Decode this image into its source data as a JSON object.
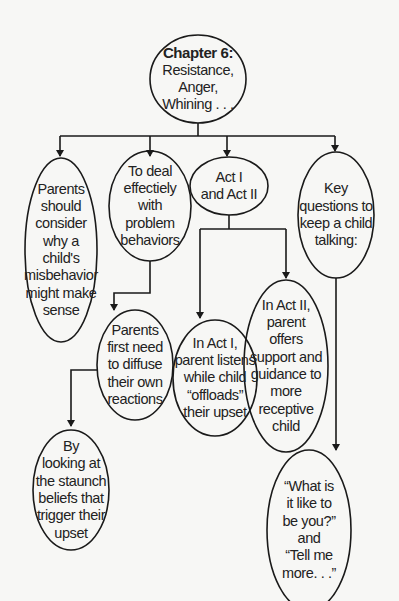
{
  "diagram": {
    "root": {
      "title": "Chapter 6:",
      "subtitle": "Resistance, Anger,\nWhining . . ."
    },
    "nodes": {
      "consider": {
        "text": "Parents\nshould\nconsider\nwhy a child's\nmisbehavior\nmight make\nsense"
      },
      "deal": {
        "text": "To deal\neffectiely\nwith\nproblem\nbehaviors"
      },
      "acts": {
        "text": "Act I\nand Act II"
      },
      "questions": {
        "text": "Key\nquestions to\nkeep a child\ntalking:"
      },
      "diffuse": {
        "text": "Parents\nfirst need\nto diffuse\ntheir own\nreactions"
      },
      "act1": {
        "text": "In Act I,\nparent listens\nwhile child\n“offloads”\ntheir upset"
      },
      "act2": {
        "text": "In Act II,\nparent\noffers\nsupport and\nguidance to\nmore\nreceptive\nchild"
      },
      "beliefs": {
        "text": "By\nlooking at\nthe staunch\nbeliefs that\ntrigger their\nupset"
      },
      "quotes": {
        "text": "“What is\nit like to\nbe you?”\nand\n“Tell me\nmore. . .”"
      }
    },
    "edges": [
      [
        "root",
        "consider"
      ],
      [
        "root",
        "deal"
      ],
      [
        "root",
        "acts"
      ],
      [
        "root",
        "questions"
      ],
      [
        "deal",
        "diffuse"
      ],
      [
        "acts",
        "act1"
      ],
      [
        "acts",
        "act2"
      ],
      [
        "diffuse",
        "beliefs"
      ],
      [
        "questions",
        "quotes"
      ]
    ],
    "colors": {
      "line": "#1a1a1a",
      "background": "#f7f7f5",
      "text": "#222222"
    }
  }
}
